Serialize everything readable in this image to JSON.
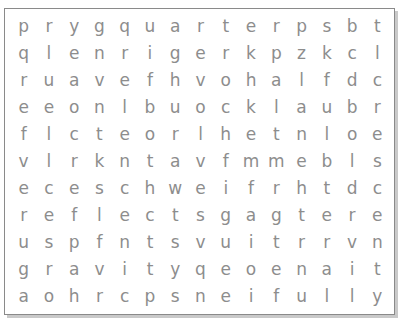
{
  "puzzle": {
    "rows": [
      [
        "p",
        "r",
        "y",
        "g",
        "q",
        "u",
        "a",
        "r",
        "t",
        "e",
        "r",
        "p",
        "s",
        "b",
        "t"
      ],
      [
        "q",
        "l",
        "e",
        "n",
        "r",
        "i",
        "g",
        "e",
        "r",
        "k",
        "p",
        "z",
        "k",
        "c",
        "l"
      ],
      [
        "r",
        "u",
        "a",
        "v",
        "e",
        "f",
        "h",
        "v",
        "o",
        "h",
        "a",
        "l",
        "f",
        "d",
        "c"
      ],
      [
        "e",
        "e",
        "o",
        "n",
        "l",
        "b",
        "u",
        "o",
        "c",
        "k",
        "l",
        "a",
        "u",
        "b",
        "r"
      ],
      [
        "f",
        "l",
        "c",
        "t",
        "e",
        "o",
        "r",
        "l",
        "h",
        "e",
        "t",
        "n",
        "l",
        "o",
        "e"
      ],
      [
        "v",
        "l",
        "r",
        "k",
        "n",
        "t",
        "a",
        "v",
        "f",
        "m",
        "m",
        "e",
        "b",
        "l",
        "s"
      ],
      [
        "e",
        "c",
        "e",
        "s",
        "c",
        "h",
        "w",
        "e",
        "i",
        "f",
        "r",
        "h",
        "t",
        "d",
        "c"
      ],
      [
        "r",
        "e",
        "f",
        "l",
        "e",
        "c",
        "t",
        "s",
        "g",
        "a",
        "g",
        "t",
        "e",
        "r",
        "e"
      ],
      [
        "u",
        "s",
        "p",
        "f",
        "n",
        "t",
        "s",
        "v",
        "u",
        "i",
        "t",
        "r",
        "r",
        "v",
        "n"
      ],
      [
        "g",
        "r",
        "a",
        "v",
        "i",
        "t",
        "y",
        "q",
        "e",
        "o",
        "e",
        "n",
        "a",
        "i",
        "t"
      ],
      [
        "a",
        "o",
        "h",
        "r",
        "c",
        "p",
        "s",
        "n",
        "e",
        "i",
        "f",
        "u",
        "l",
        "l",
        "y"
      ]
    ]
  }
}
